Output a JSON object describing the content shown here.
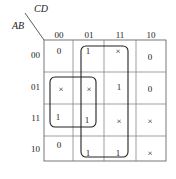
{
  "axes": {
    "row_var": "AB",
    "col_var": "CD"
  },
  "col_headers": [
    "00",
    "01",
    "11",
    "10"
  ],
  "row_headers": [
    "00",
    "01",
    "11",
    "10"
  ],
  "cells": [
    [
      "0",
      "1",
      "×",
      "0"
    ],
    [
      "×",
      "×",
      "1",
      "0"
    ],
    [
      "1",
      "1",
      "×",
      "×"
    ],
    [
      "0",
      "1",
      "1",
      "×"
    ]
  ],
  "groups": [
    {
      "name": "group-columns-01-11",
      "description": "Columns CD=01 and CD=11, all rows"
    },
    {
      "name": "group-rows-01-11-cols-00-01",
      "description": "Rows AB=01,11 × columns CD=00,01"
    }
  ]
}
